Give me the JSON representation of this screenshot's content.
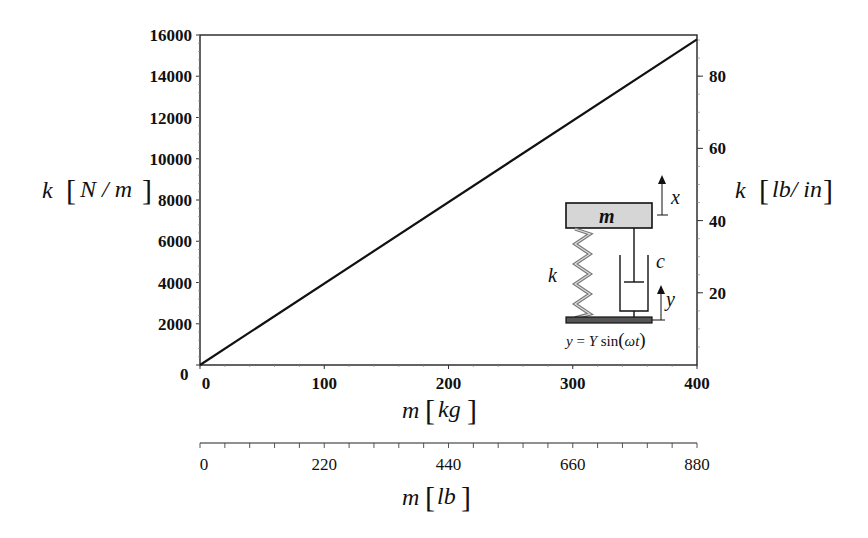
{
  "chart_data": {
    "type": "line",
    "title": "",
    "x": [
      0,
      100,
      200,
      300,
      400
    ],
    "series": [
      {
        "name": "k vs m",
        "x": [
          0,
          400
        ],
        "values": [
          0,
          15791
        ]
      }
    ],
    "xlabel": "m [kg]",
    "ylabel": "k [N/m]",
    "xlim": [
      0,
      400
    ],
    "ylim": [
      0,
      16000
    ],
    "x_ticks": [
      "0",
      "100",
      "200",
      "300",
      "400"
    ],
    "y_ticks": [
      "0",
      "2000",
      "4000",
      "6000",
      "8000",
      "10000",
      "12000",
      "14000",
      "16000"
    ],
    "secondary_y": {
      "label": "k [lb/in]",
      "ticks": [
        "20",
        "40",
        "60",
        "80"
      ],
      "range": [
        0,
        91.4
      ]
    },
    "secondary_x": {
      "label": "m [lb]",
      "ticks": [
        "0",
        "220",
        "440",
        "660",
        "880"
      ],
      "range": [
        0,
        880
      ]
    },
    "grid": false,
    "legend": "none",
    "annotations": [
      "Inset: base-excited mass-spring-damper diagram",
      "m",
      "k",
      "c",
      "x",
      "y",
      "y = Y sin(ωt)"
    ]
  },
  "labels": {
    "y_left_var": "k",
    "y_left_unit": "N / m",
    "y_right_var": "k",
    "y_right_unit": "lb/ in",
    "x_bottom_var": "m",
    "x_bottom_unit": "kg",
    "x_lb_var": "m",
    "x_lb_unit": "lb"
  },
  "inset": {
    "mass_label": "m",
    "spring_label": "k",
    "damper_label": "c",
    "mass_disp_label": "x",
    "base_disp_label": "y",
    "equation_lhs": "y",
    "equation_eq": " = ",
    "equation_amp": "Y",
    "equation_fn": " sin",
    "equation_arg": "ωt"
  }
}
